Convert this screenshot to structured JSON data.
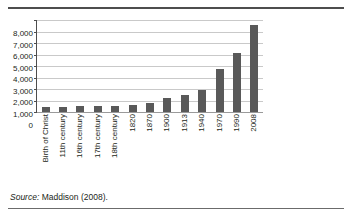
{
  "figure": {
    "source_prefix": "Source:",
    "source_text": "Maddison (2008)."
  },
  "chart_data": {
    "type": "bar",
    "title": "",
    "subtitle": "",
    "xlabel": "",
    "ylabel": "",
    "categories": [
      "Birth of Christ",
      "11th century",
      "16th century",
      "17th century",
      "18th century",
      "1820",
      "1870",
      "1900",
      "1913",
      "1940",
      "1970",
      "1990",
      "2008"
    ],
    "values": [
      400,
      400,
      500,
      500,
      550,
      600,
      800,
      1200,
      1450,
      1900,
      3700,
      5100,
      7550
    ],
    "ylim": [
      0,
      8000
    ],
    "ytick_values": [
      8000,
      7000,
      6000,
      5000,
      4000,
      3000,
      2000,
      1000,
      0
    ],
    "ytick_labels": [
      "8,000",
      "7,000",
      "6,000",
      "5,000",
      "4,000",
      "3,000",
      "2,000",
      "1,000",
      "0"
    ],
    "grid": true,
    "grid_axis": "y",
    "legend": false,
    "legend_position": "none",
    "bar_color": "#595959",
    "gridline_color": "#c9c9c9",
    "axis_color": "#4d4d4d"
  }
}
